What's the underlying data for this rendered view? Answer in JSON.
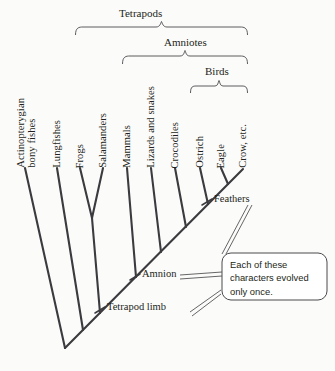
{
  "figure": {
    "type": "phylogenetic-cladogram",
    "background_color": "#fbfbfa",
    "line_color": "#3b3b3f",
    "text_color": "#231f20"
  },
  "clades": [
    {
      "name": "Tetrapods",
      "label": "Tetrapods",
      "bracket_left": 75,
      "bracket_right": 248,
      "label_y": 8,
      "bracket_y": 26
    },
    {
      "name": "Amniotes",
      "label": "Amniotes",
      "bracket_left": 122,
      "bracket_right": 248,
      "label_y": 37,
      "bracket_y": 55
    },
    {
      "name": "Birds",
      "label": "Birds",
      "bracket_left": 190,
      "bracket_right": 248,
      "label_y": 66,
      "bracket_y": 84
    }
  ],
  "taxa": [
    {
      "label": "Actinopterygian\nbony fishes",
      "short": "actinopterygian-bony-fishes",
      "lines": [
        "Actinopterygian",
        "bony fishes"
      ],
      "x": 25,
      "tip_y": 168
    },
    {
      "label": "Lungfishes",
      "short": "lungfishes",
      "lines": [
        "Lungfishes"
      ],
      "x": 57,
      "tip_y": 168
    },
    {
      "label": "Frogs",
      "short": "frogs",
      "lines": [
        "Frogs"
      ],
      "x": 80,
      "tip_y": 168
    },
    {
      "label": "Salamanders",
      "short": "salamanders",
      "lines": [
        "Salamanders"
      ],
      "x": 103,
      "tip_y": 168
    },
    {
      "label": "Mammals",
      "short": "mammals",
      "lines": [
        "Mammals"
      ],
      "x": 127,
      "tip_y": 168
    },
    {
      "label": "Lizards and snakes",
      "short": "lizards-and-snakes",
      "lines": [
        "Lizards and snakes"
      ],
      "x": 151,
      "tip_y": 168
    },
    {
      "label": "Crocodiles",
      "short": "crocodiles",
      "lines": [
        "Crocodiles"
      ],
      "x": 175,
      "tip_y": 168
    },
    {
      "label": "Ostrich",
      "short": "ostrich",
      "lines": [
        "Ostrich"
      ],
      "x": 200,
      "tip_y": 168
    },
    {
      "label": "Eagle",
      "short": "eagle",
      "lines": [
        "Eagle"
      ],
      "x": 221,
      "tip_y": 168
    },
    {
      "label": "Crow, etc.",
      "short": "crow-etc",
      "lines": [
        "Crow, etc."
      ],
      "x": 243,
      "tip_y": 168
    }
  ],
  "characters": [
    {
      "label": "Feathers",
      "name": "feathers",
      "tick_x": 207,
      "tick_y": 202,
      "text_x": 214,
      "text_y": 196
    },
    {
      "label": "Amnion",
      "name": "amnion",
      "tick_x": 135,
      "tick_y": 277,
      "text_x": 142,
      "text_y": 271
    },
    {
      "label": "Tetrapod limb",
      "name": "tetrapod-limb",
      "tick_x": 100,
      "tick_y": 310,
      "text_x": 107,
      "text_y": 304
    }
  ],
  "callout": {
    "text": "Each of these\ncharacters evolved\nonly once.",
    "box": {
      "x": 222,
      "y": 253,
      "width": 105,
      "height": 47
    }
  }
}
